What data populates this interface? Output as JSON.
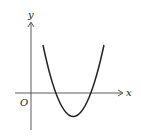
{
  "diagram": {
    "type": "function-graph",
    "axes": {
      "x_label": "x",
      "y_label": "y",
      "origin_label": "O"
    },
    "curve": {
      "shape": "parabola",
      "opens": "up",
      "x_intercepts": "two positive roots",
      "vertex": "below x-axis, right of y-axis"
    },
    "colors": {
      "line": "#222222",
      "background": "#ffffff"
    }
  }
}
